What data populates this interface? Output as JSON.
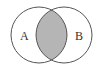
{
  "diagram": {
    "type": "venn",
    "sets": [
      {
        "label": "A",
        "cx": 39,
        "cy": 35,
        "r": 28
      },
      {
        "label": "B",
        "cx": 64,
        "cy": 35,
        "r": 28
      }
    ],
    "shaded_region": "A ∩ B",
    "colors": {
      "background": "#ffffff",
      "outline": "#555555",
      "shade": "#b5b5b5"
    }
  }
}
